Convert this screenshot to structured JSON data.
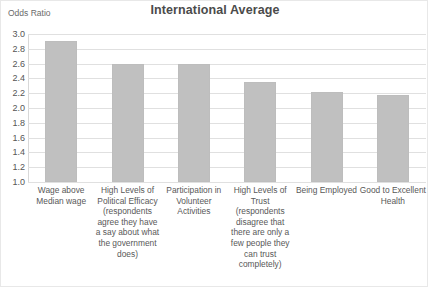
{
  "chart_data": {
    "type": "bar",
    "title": "International Average",
    "xlabel": "",
    "ylabel": "Odds Ratio",
    "ylim": [
      1.0,
      3.0
    ],
    "grid": true,
    "legend": false,
    "yticks": [
      "3.0",
      "2.8",
      "2.6",
      "2.4",
      "2.2",
      "2.0",
      "1.8",
      "1.6",
      "1.4",
      "1.2",
      "1.0"
    ],
    "ytick_values": [
      3.0,
      2.8,
      2.6,
      2.4,
      2.2,
      2.0,
      1.8,
      1.6,
      1.4,
      1.2,
      1.0
    ],
    "categories": [
      "Wage above Median wage",
      "High Levels of Political Efficacy (respondents agree they have a say about what the government does)",
      "Participation in Volunteer Activities",
      "High Levels of Trust (respondents disagree that there are only a few people they can trust completely)",
      "Being Employed",
      "Good to Excellent Health"
    ],
    "values": [
      2.9,
      2.6,
      2.6,
      2.35,
      2.22,
      2.17
    ],
    "bar_color": "#c0c0c0"
  },
  "colors": {
    "bar": "#c0c0c0",
    "gridline": "#e0e0e0",
    "title_text": "#4b4b4b",
    "tick_text": "#555555",
    "label_text": "#585858"
  }
}
